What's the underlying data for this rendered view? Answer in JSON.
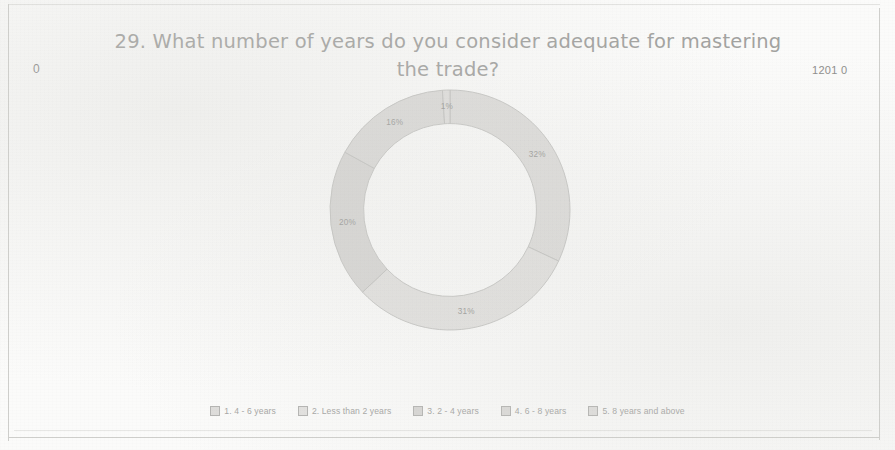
{
  "page": {
    "corner_left_number": "0",
    "corner_right_number": "1201 0"
  },
  "header": {
    "title": "29. What number of years do you consider adequate for mastering the trade?"
  },
  "legend": {
    "items": [
      {
        "label": "1. 4 - 6 years",
        "color": "#dedddb"
      },
      {
        "label": "2. Less than 2 years",
        "color": "#e3e2e0"
      },
      {
        "label": "3. 2 - 4 years",
        "color": "#d8d7d5"
      },
      {
        "label": "4. 6 - 8 years",
        "color": "#dcdbd9"
      },
      {
        "label": "5. 8 years and above",
        "color": "#e0dfdd"
      }
    ]
  },
  "chart_data": {
    "type": "pie",
    "variant": "donut",
    "title": "29. What number of years do you consider adequate for mastering the trade?",
    "start_angle_deg": 0,
    "direction": "clockwise",
    "inner_radius_ratio": 0.72,
    "legend_position": "bottom",
    "value_unit": "percent",
    "categories": [
      "1. 4 - 6 years",
      "2. Less than 2 years",
      "3. 2 - 4 years",
      "4. 6 - 8 years",
      "5. 8 years and above"
    ],
    "values": [
      32,
      31,
      20,
      16,
      1
    ],
    "labels": [
      "32%",
      "31%",
      "20%",
      "16%",
      "1%"
    ],
    "slices": [
      {
        "category": "1. 4 - 6 years",
        "value": 32,
        "label": "32%",
        "color": "#dedddb"
      },
      {
        "category": "2. Less than 2 years",
        "value": 31,
        "label": "31%",
        "color": "#e3e2e0"
      },
      {
        "category": "3. 2 - 4 years",
        "value": 20,
        "label": "20%",
        "color": "#d8d7d5"
      },
      {
        "category": "4. 6 - 8 years",
        "value": 16,
        "label": "16%",
        "color": "#dcdbd9"
      },
      {
        "category": "5. 8 years and above",
        "value": 1,
        "label": "1%",
        "color": "#e0dfdd"
      }
    ]
  }
}
